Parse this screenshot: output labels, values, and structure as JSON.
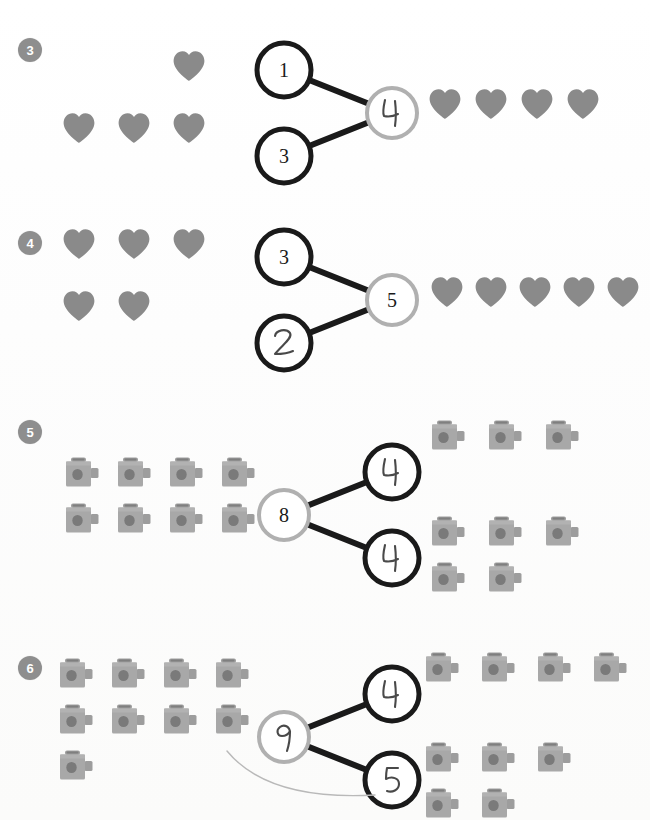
{
  "page": {
    "background_color": "#fdfdfc",
    "bullet_color": "#8e8e8e",
    "heart_color": "#8a8a8a",
    "cube_body_color": "#a8a8a8",
    "cube_dot_color": "#7a7a7a",
    "ink_black": "#1a1a1a",
    "ink_gray": "#b0b0b0",
    "handwriting_color": "#3a3a3a"
  },
  "problems": [
    {
      "number": "3",
      "manipulative": "heart",
      "left_group": {
        "label": "hearts-left-group",
        "total": 4,
        "rows": [
          {
            "count": 1,
            "offset_cols": 2
          },
          {
            "count": 3,
            "offset_cols": 0
          }
        ]
      },
      "number_bond": {
        "orientation": "parts-left-whole-right",
        "parts": [
          {
            "value": "1",
            "style": "printed",
            "ring": "black"
          },
          {
            "value": "3",
            "style": "printed",
            "ring": "black"
          }
        ],
        "whole": {
          "value": "4",
          "style": "handwritten",
          "ring": "gray"
        }
      },
      "right_group": {
        "label": "hearts-right-group",
        "total": 4,
        "rows": [
          {
            "count": 4,
            "offset_cols": 0
          }
        ]
      }
    },
    {
      "number": "4",
      "manipulative": "heart",
      "left_group": {
        "label": "hearts-left-group",
        "total": 5,
        "rows": [
          {
            "count": 3,
            "offset_cols": 0
          },
          {
            "count": 2,
            "offset_cols": 0
          }
        ]
      },
      "number_bond": {
        "orientation": "parts-left-whole-right",
        "parts": [
          {
            "value": "3",
            "style": "printed",
            "ring": "black"
          },
          {
            "value": "2",
            "style": "handwritten",
            "ring": "black"
          }
        ],
        "whole": {
          "value": "5",
          "style": "printed",
          "ring": "gray"
        }
      },
      "right_group": {
        "label": "hearts-right-group",
        "total": 5,
        "rows": [
          {
            "count": 5,
            "offset_cols": 0
          }
        ]
      }
    },
    {
      "number": "5",
      "manipulative": "cube",
      "left_group": {
        "label": "cubes-left-group",
        "total": 8,
        "rows": [
          {
            "count": 4,
            "offset_cols": 0
          },
          {
            "count": 4,
            "offset_cols": 0
          }
        ]
      },
      "number_bond": {
        "orientation": "whole-left-parts-right",
        "whole": {
          "value": "8",
          "style": "printed",
          "ring": "gray"
        },
        "parts": [
          {
            "value": "4",
            "style": "handwritten",
            "ring": "black"
          },
          {
            "value": "4",
            "style": "handwritten",
            "ring": "black"
          }
        ]
      },
      "right_group": {
        "label": "cubes-right-group",
        "total": 8,
        "clusters": [
          {
            "rows": [
              {
                "count": 3
              }
            ]
          },
          {
            "rows": [
              {
                "count": 3
              },
              {
                "count": 2
              }
            ]
          }
        ]
      }
    },
    {
      "number": "6",
      "manipulative": "cube",
      "left_group": {
        "label": "cubes-left-group",
        "total": 9,
        "rows": [
          {
            "count": 4,
            "offset_cols": 0
          },
          {
            "count": 4,
            "offset_cols": 0
          },
          {
            "count": 1,
            "offset_cols": 0
          }
        ]
      },
      "number_bond": {
        "orientation": "whole-left-parts-right",
        "whole": {
          "value": "9",
          "style": "handwritten",
          "ring": "gray"
        },
        "parts": [
          {
            "value": "4",
            "style": "handwritten",
            "ring": "black"
          },
          {
            "value": "5",
            "style": "handwritten",
            "ring": "black"
          }
        ]
      },
      "right_group": {
        "label": "cubes-right-group",
        "total": 9,
        "clusters": [
          {
            "rows": [
              {
                "count": 4
              }
            ]
          },
          {
            "rows": [
              {
                "count": 3
              },
              {
                "count": 2
              }
            ]
          }
        ]
      }
    }
  ],
  "artifacts": {
    "stray_pencil_arc": "present-below-row-6-bond"
  }
}
